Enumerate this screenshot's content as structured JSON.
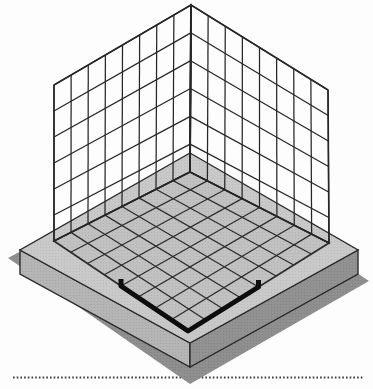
{
  "diagram": {
    "canvas": {
      "width": 373,
      "height": 389
    },
    "colors": {
      "background": "#fdfdfd",
      "top_face_base": "#c9c9c9",
      "top_face_dot": "#adadad",
      "grid_area_base": "#c1c1c1",
      "grid_area_dot": "#a6a6a6",
      "left_face_base": "#b5b5b5",
      "left_face_dot": "#979797",
      "right_face_base": "#929292",
      "right_face_dot": "#757575",
      "shadow_base": "#8f8f8f",
      "shadow_dot": "#6f6f6f",
      "floor_line": "#2d2d2d",
      "wall_line": "#262626",
      "outline": "#2b2b2b",
      "highlight": "#0d0d0d",
      "baseline": "#3c3c3c"
    },
    "walls": {
      "left": {
        "apex_top": [
          191,
          5
        ],
        "far_top": [
          54,
          85
        ],
        "apex_bottom": [
          190,
          172
        ],
        "far_bottom": [
          54,
          241
        ],
        "cols": 8,
        "rows": 6
      },
      "right": {
        "apex_top": [
          191,
          5
        ],
        "far_top": [
          328,
          90
        ],
        "apex_bottom": [
          190,
          172
        ],
        "far_bottom": [
          329,
          243
        ],
        "cols": 8,
        "rows": 6
      }
    },
    "floor": {
      "corners": {
        "B": [
          190,
          172
        ],
        "R": [
          329,
          243
        ],
        "F": [
          188,
          331
        ],
        "L": [
          54,
          241
        ]
      },
      "cells": 8,
      "line_width": 1.25,
      "edge_width": 1.7
    },
    "platform": {
      "top": {
        "back": [
          190,
          153
        ],
        "right": [
          358,
          250
        ],
        "front": [
          190,
          343
        ],
        "left": [
          20,
          250
        ]
      },
      "thickness": 24,
      "outline_width": 1.4
    },
    "shadow": {
      "points": [
        [
          190,
          161
        ],
        [
          8,
          258
        ],
        [
          190,
          384
        ],
        [
          369,
          281
        ]
      ]
    },
    "highlight": {
      "cells_from_front_corner": 4,
      "stroke_width": 5,
      "end_tick": 7
    },
    "baseline": {
      "y": 377.5,
      "x1": 13,
      "x2": 364,
      "width": 2,
      "dash": "1.6 2.1"
    }
  }
}
